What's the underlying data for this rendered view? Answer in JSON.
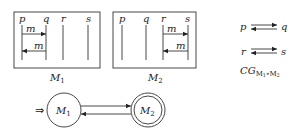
{
  "msc": [
    {
      "name": "M",
      "index": "1",
      "processes": [
        "p",
        "q",
        "r",
        "s"
      ],
      "messages": [
        {
          "label": "m",
          "from": "p",
          "to": "q"
        },
        {
          "label": "m",
          "from": "q",
          "to": "p"
        }
      ]
    },
    {
      "name": "M",
      "index": "2",
      "processes": [
        "p",
        "q",
        "r",
        "s"
      ],
      "messages": [
        {
          "label": "m",
          "from": "r",
          "to": "s"
        },
        {
          "label": "m",
          "from": "s",
          "to": "r"
        }
      ]
    }
  ],
  "communication_graph": {
    "edges": [
      {
        "a": "p",
        "b": "q"
      },
      {
        "a": "r",
        "b": "s"
      }
    ],
    "label_main": "CG",
    "label_sub_1": "M",
    "label_sub_1_idx": "1",
    "label_sub_op": "∘",
    "label_sub_2": "M",
    "label_sub_2_idx": "2"
  },
  "automaton": {
    "initial_marker": "⇒",
    "states": [
      {
        "name": "M",
        "index": "1",
        "accepting": false
      },
      {
        "name": "M",
        "index": "2",
        "accepting": true
      }
    ]
  }
}
